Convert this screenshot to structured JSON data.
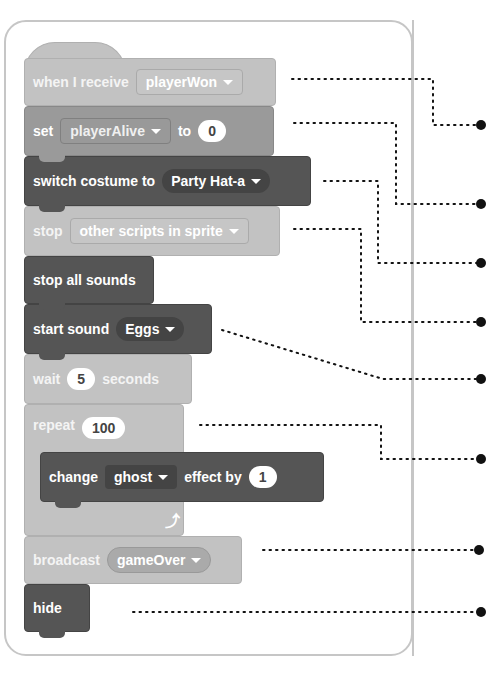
{
  "blocks": {
    "when_receive": {
      "label": "when I receive",
      "value": "playerWon"
    },
    "set_var": {
      "label": "set",
      "var": "playerAlive",
      "to": "to",
      "value": "0"
    },
    "switch_costume": {
      "label": "switch costume to",
      "value": "Party Hat-a"
    },
    "stop": {
      "label": "stop",
      "value": "other scripts in sprite"
    },
    "stop_sounds": {
      "label": "stop all sounds"
    },
    "start_sound": {
      "label": "start sound",
      "value": "Eggs"
    },
    "wait": {
      "label": "wait",
      "value": "5",
      "suffix": "seconds"
    },
    "repeat": {
      "label": "repeat",
      "value": "100"
    },
    "change_effect": {
      "label": "change",
      "effect": "ghost",
      "by": "effect by",
      "value": "1"
    },
    "broadcast": {
      "label": "broadcast",
      "value": "gameOver"
    },
    "hide": {
      "label": "hide"
    }
  },
  "icons": {
    "dropdown": "caret-down-icon",
    "loop": "loop-arrow-icon",
    "callout": "bullet-dot-icon"
  },
  "colors": {
    "light_block": "#c2c2c2",
    "mid_block": "#9a9a9a",
    "dark_block": "#555555",
    "panel_border": "#c6c6c6",
    "callout": "#111111"
  }
}
